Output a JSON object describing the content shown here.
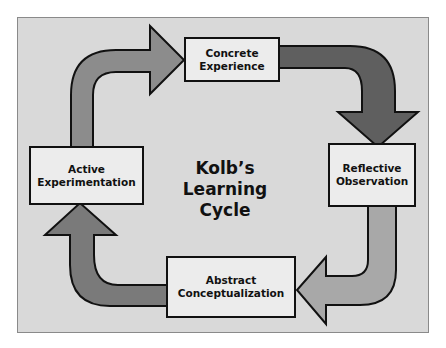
{
  "diagram": {
    "title_line1": "Kolb’s",
    "title_line2": "Learning Cycle",
    "stages": [
      {
        "id": "concrete-experience",
        "line1": "Concrete",
        "line2": "Experience"
      },
      {
        "id": "reflective-observation",
        "line1": "Reflective",
        "line2": "Observation"
      },
      {
        "id": "abstract-conceptualization",
        "line1": "Abstract",
        "line2": "Conceptualization"
      },
      {
        "id": "active-experimentation",
        "line1": "Active",
        "line2": "Experimentation"
      }
    ],
    "colors": {
      "background": "#d9d9d9",
      "box_fill": "#ececec",
      "outline": "#111111",
      "arrow_dark": "#5f5f5f",
      "arrow_medium": "#8c8c8c",
      "arrow_light": "#a8a8a8"
    }
  }
}
